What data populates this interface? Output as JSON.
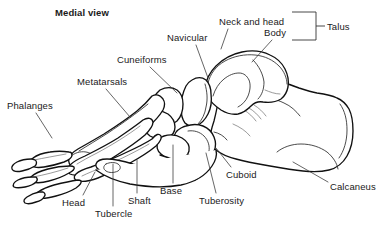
{
  "figure": {
    "title": "Medial view",
    "view_orientation": "medial",
    "background_color": "#ffffff",
    "line_color": "#111111",
    "text_color": "#1a1a1a"
  },
  "labels": [
    {
      "id": "medial-view",
      "text": "Medial view",
      "x": 55,
      "y": 7,
      "bold": true,
      "has_leader": false
    },
    {
      "id": "neck-and-head",
      "text": "Neck and head",
      "x": 219,
      "y": 16,
      "bold": false,
      "has_leader": true
    },
    {
      "id": "body",
      "text": "Body",
      "x": 264,
      "y": 27,
      "bold": false,
      "has_leader": true
    },
    {
      "id": "talus",
      "text": "Talus",
      "x": 327,
      "y": 21,
      "bold": false,
      "has_leader": false
    },
    {
      "id": "navicular",
      "text": "Navicular",
      "x": 167,
      "y": 32,
      "bold": false,
      "has_leader": true
    },
    {
      "id": "cuneiforms",
      "text": "Cuneiforms",
      "x": 117,
      "y": 54,
      "bold": false,
      "has_leader": true
    },
    {
      "id": "metatarsals",
      "text": "Metatarsals",
      "x": 77,
      "y": 76,
      "bold": false,
      "has_leader": true
    },
    {
      "id": "phalanges",
      "text": "Phalanges",
      "x": 7,
      "y": 100,
      "bold": false,
      "has_leader": true
    },
    {
      "id": "cuboid",
      "text": "Cuboid",
      "x": 226,
      "y": 169,
      "bold": false,
      "has_leader": true
    },
    {
      "id": "calcaneus",
      "text": "Calcaneus",
      "x": 330,
      "y": 181,
      "bold": false,
      "has_leader": true
    },
    {
      "id": "base",
      "text": "Base",
      "x": 160,
      "y": 185,
      "bold": false,
      "has_leader": true
    },
    {
      "id": "tuberosity",
      "text": "Tuberosity",
      "x": 199,
      "y": 195,
      "bold": false,
      "has_leader": true
    },
    {
      "id": "head",
      "text": "Head",
      "x": 62,
      "y": 197,
      "bold": false,
      "has_leader": true
    },
    {
      "id": "shaft",
      "text": "Shaft",
      "x": 128,
      "y": 195,
      "bold": false,
      "has_leader": true
    },
    {
      "id": "tubercle",
      "text": "Tubercle",
      "x": 95,
      "y": 208,
      "bold": false,
      "has_leader": true
    }
  ],
  "bracket": {
    "id": "talus-bracket",
    "description": "square bracket grouping Neck and head + Body under Talus",
    "top_y": 12,
    "bottom_y": 40,
    "right_x": 316,
    "left_x": 292,
    "tick_end_x": 325
  },
  "leader_lines": [
    {
      "for": "neck-and-head",
      "path": "M 228 29 L 221 49"
    },
    {
      "for": "body",
      "path": "M 272 40 L 252 62"
    },
    {
      "for": "navicular",
      "path": "M 196 45 L 208 78"
    },
    {
      "for": "cuneiforms",
      "path": "M 150 67 L 177 93"
    },
    {
      "for": "metatarsals",
      "path": "M 106 89 L 130 117"
    },
    {
      "for": "phalanges",
      "path": "M 36 113 L 52 138"
    },
    {
      "for": "cuboid",
      "path": "M 231 167 L 216 148"
    },
    {
      "for": "calcaneus",
      "path": "M 328 182 L 293 162"
    },
    {
      "for": "base",
      "path": "M 173 183 L 173 145"
    },
    {
      "for": "tuberosity",
      "path": "M 216 193 L 206 153"
    },
    {
      "for": "head",
      "path": "M 83 195 L 95 172"
    },
    {
      "for": "shaft",
      "path": "M 137 193 L 137 160"
    },
    {
      "for": "tubercle",
      "path": "M 113 206 L 113 164"
    }
  ],
  "bones": [
    {
      "id": "calcaneus-bone",
      "name": "Calcaneus"
    },
    {
      "id": "talus-bone",
      "name": "Talus"
    },
    {
      "id": "navicular-bone",
      "name": "Navicular"
    },
    {
      "id": "cuboid-bone",
      "name": "Cuboid"
    },
    {
      "id": "cuneiform-bones",
      "name": "Cuneiforms"
    },
    {
      "id": "metatarsal-bones",
      "name": "Metatarsals"
    },
    {
      "id": "phalange-bones",
      "name": "Phalanges"
    }
  ]
}
